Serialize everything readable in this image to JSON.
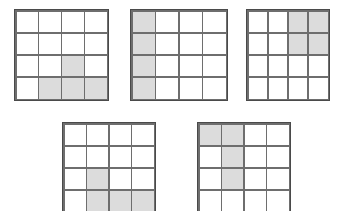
{
  "canvas": {
    "width": 345,
    "height": 211,
    "background": "#ffffff"
  },
  "style": {
    "line_color": "#4a4a4a",
    "line_color_inner": "#6e6e6e",
    "shaded_cell_color": "#dcdcdc",
    "empty_cell_color": "#ffffff"
  },
  "chart_data": {
    "type": "heatmap",
    "title": "",
    "subtitle": "",
    "xlabel": "",
    "ylabel": "",
    "grid": true,
    "legend": "none",
    "rows": 4,
    "columns": 4,
    "value_legend": {
      "0": "empty",
      "1": "shaded"
    },
    "panels": [
      {
        "name": "grid-1",
        "position": "top-left",
        "x": 14,
        "y": 9,
        "width": 95,
        "height": 92,
        "clipped": false,
        "shaded_cells": [
          [
            3,
            3
          ],
          [
            4,
            2
          ],
          [
            4,
            3
          ],
          [
            4,
            4
          ]
        ],
        "shaded_count": 4,
        "matrix": [
          [
            0,
            0,
            0,
            0
          ],
          [
            0,
            0,
            0,
            0
          ],
          [
            0,
            0,
            1,
            0
          ],
          [
            0,
            1,
            1,
            1
          ]
        ]
      },
      {
        "name": "grid-2",
        "position": "top-center",
        "x": 130,
        "y": 9,
        "width": 98,
        "height": 92,
        "clipped": false,
        "shaded_cells": [
          [
            1,
            1
          ],
          [
            2,
            1
          ],
          [
            3,
            1
          ],
          [
            4,
            1
          ]
        ],
        "shaded_count": 4,
        "matrix": [
          [
            1,
            0,
            0,
            0
          ],
          [
            1,
            0,
            0,
            0
          ],
          [
            1,
            0,
            0,
            0
          ],
          [
            1,
            0,
            0,
            0
          ]
        ]
      },
      {
        "name": "grid-3",
        "position": "top-right",
        "x": 246,
        "y": 9,
        "width": 84,
        "height": 92,
        "clipped": false,
        "shaded_cells": [
          [
            1,
            3
          ],
          [
            1,
            4
          ],
          [
            2,
            3
          ],
          [
            2,
            4
          ]
        ],
        "shaded_count": 4,
        "matrix": [
          [
            0,
            0,
            1,
            1
          ],
          [
            0,
            0,
            1,
            1
          ],
          [
            0,
            0,
            0,
            0
          ],
          [
            0,
            0,
            0,
            0
          ]
        ]
      },
      {
        "name": "grid-4",
        "position": "bottom-left",
        "x": 62,
        "y": 122,
        "width": 94,
        "height": 92,
        "clipped": true,
        "shaded_cells": [
          [
            3,
            2
          ],
          [
            4,
            2
          ],
          [
            4,
            3
          ],
          [
            4,
            4
          ]
        ],
        "shaded_count": 4,
        "matrix": [
          [
            0,
            0,
            0,
            0
          ],
          [
            0,
            0,
            0,
            0
          ],
          [
            0,
            1,
            0,
            0
          ],
          [
            0,
            1,
            1,
            1
          ]
        ]
      },
      {
        "name": "grid-5",
        "position": "bottom-right",
        "x": 197,
        "y": 122,
        "width": 94,
        "height": 92,
        "clipped": true,
        "shaded_cells": [
          [
            1,
            1
          ],
          [
            1,
            2
          ],
          [
            2,
            2
          ],
          [
            3,
            2
          ]
        ],
        "shaded_count": 4,
        "matrix": [
          [
            1,
            1,
            0,
            0
          ],
          [
            0,
            1,
            0,
            0
          ],
          [
            0,
            1,
            0,
            0
          ],
          [
            0,
            0,
            0,
            0
          ]
        ]
      }
    ]
  }
}
